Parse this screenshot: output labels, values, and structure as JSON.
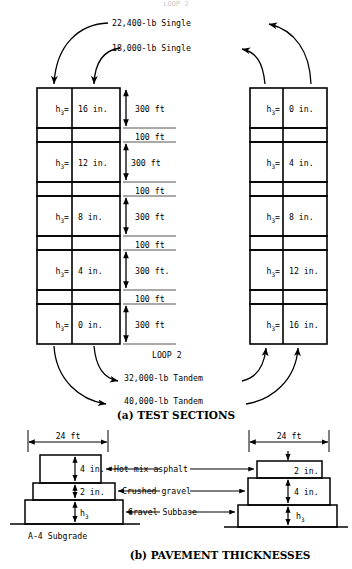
{
  "figure": {
    "top_partial_label": "LOOP 2",
    "panel_a_caption": "(a) TEST SECTIONS",
    "panel_b_caption": "(b) PAVEMENT THICKNESSES"
  },
  "loads": {
    "top_upper": "22,400-lb Single",
    "top_lower": "18,000-lb Single",
    "loop_label": "LOOP 2",
    "bottom_upper": "32,000-lb Tandem",
    "bottom_lower": "40,000-lb Tandem"
  },
  "left_column": {
    "h_label": "h",
    "h_sub": "3",
    "eq": "=",
    "sections": [
      {
        "value": "16 in.",
        "length": "300 ft"
      },
      {
        "value": "12 in.",
        "length": "300 ft"
      },
      {
        "value": "8 in.",
        "length": "300 ft"
      },
      {
        "value": "4 in.",
        "length": "300 ft."
      },
      {
        "value": "0 in.",
        "length": "300 ft"
      }
    ],
    "gap_length": "100 ft",
    "gaps": [
      "100 ft",
      "100 ft",
      "100 ft",
      "100 ft"
    ]
  },
  "right_column": {
    "h_label": "h",
    "h_sub": "3",
    "eq": "=",
    "sections": [
      {
        "value": "0 in."
      },
      {
        "value": "4 in."
      },
      {
        "value": "8 in."
      },
      {
        "value": "12 in."
      },
      {
        "value": "16 in."
      }
    ]
  },
  "pavement": {
    "layer_names": {
      "asphalt": "Hot mix asphalt",
      "base": "Crushed gravel",
      "subbase": "Gravel Subbase"
    },
    "subgrade": "A-4  Subgrade",
    "left": {
      "width": "24 ft",
      "asphalt": "4 in.",
      "base": "2 in.",
      "subbase_label": "h",
      "subbase_sub": "3"
    },
    "right": {
      "width": "24 ft",
      "asphalt": "2 in.",
      "base": "4 in.",
      "subbase_label": "h",
      "subbase_sub": "3"
    }
  },
  "colors": {
    "ink": "#000000",
    "rule": "#555555",
    "paper": "#ffffff"
  }
}
